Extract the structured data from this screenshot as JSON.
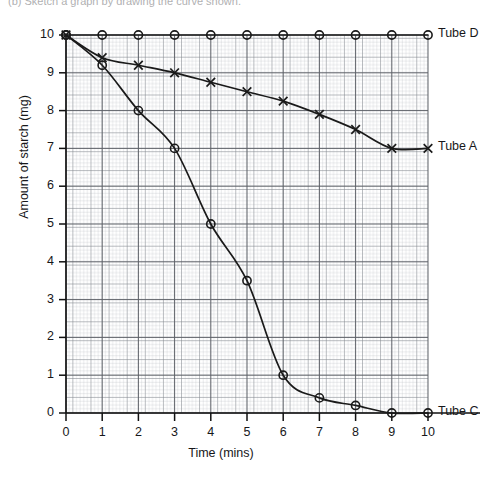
{
  "header": {
    "caption": "(b)  Sketch a graph by drawing the curve shown."
  },
  "chart_data": {
    "type": "line",
    "title": "",
    "xlabel": "Time (mins)",
    "ylabel": "Amount of starch (mg)",
    "xlim": [
      0,
      10
    ],
    "ylim": [
      0,
      10
    ],
    "xticks": [
      0,
      1,
      2,
      3,
      4,
      5,
      6,
      7,
      8,
      9,
      10
    ],
    "yticks": [
      0,
      1,
      2,
      3,
      4,
      5,
      6,
      7,
      8,
      9,
      10
    ],
    "grid": "graph-paper-minor-and-major",
    "legend_position": "right-of-line-end",
    "x": [
      0,
      1,
      2,
      3,
      4,
      5,
      6,
      7,
      8,
      9,
      10
    ],
    "series": [
      {
        "name": "Tube D",
        "label": "Tube D",
        "marker": "circle",
        "color": "#1a1a1a",
        "values": [
          10,
          10,
          10,
          10,
          10,
          10,
          10,
          10,
          10,
          10,
          10
        ]
      },
      {
        "name": "Tube A",
        "label": "Tube A",
        "marker": "cross",
        "color": "#1a1a1a",
        "values": [
          10,
          9.4,
          9.2,
          9.0,
          8.75,
          8.5,
          8.25,
          7.9,
          7.5,
          7.0,
          7.0
        ]
      },
      {
        "name": "Tube C",
        "label": "Tube C",
        "marker": "circle",
        "color": "#1a1a1a",
        "values": [
          10,
          9.2,
          8.0,
          7.0,
          5.0,
          3.5,
          1.0,
          0.4,
          0.2,
          0.0,
          0.0
        ]
      }
    ]
  },
  "axis": {
    "y_tick_labels": [
      "10",
      "9",
      "8",
      "7",
      "6",
      "5",
      "4",
      "3",
      "2",
      "1",
      "0"
    ],
    "x_tick_labels": [
      "0",
      "1",
      "2",
      "3",
      "4",
      "5",
      "6",
      "7",
      "8",
      "9",
      "10"
    ]
  }
}
